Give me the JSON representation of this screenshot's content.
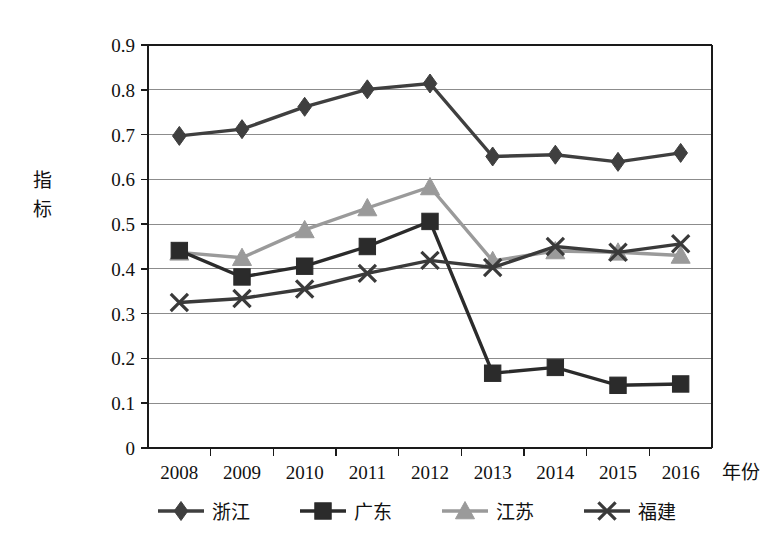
{
  "chart_data": {
    "type": "line",
    "title": "",
    "subtitle": "",
    "xlabel": "年份",
    "ylabel": "指标",
    "x": [
      "2008",
      "2009",
      "2010",
      "2011",
      "2012",
      "2013",
      "2014",
      "2015",
      "2016"
    ],
    "categories": [
      "2008",
      "2009",
      "2010",
      "2011",
      "2012",
      "2013",
      "2014",
      "2015",
      "2016"
    ],
    "ylim": [
      0,
      0.9
    ],
    "xlim_note": "categorical, 9 year bands",
    "yticks": [
      "0",
      "0.1",
      "0.2",
      "0.3",
      "0.4",
      "0.5",
      "0.6",
      "0.7",
      "0.8",
      "0.9"
    ],
    "ytick_values": [
      0,
      0.1,
      0.2,
      0.3,
      0.4,
      0.5,
      0.6,
      0.7,
      0.8,
      0.9
    ],
    "grid": "horizontal",
    "legend_position": "bottom",
    "series": [
      {
        "name": "浙江",
        "marker": "diamond",
        "color": "#3f3f3f",
        "line_color": "#3f3f3f",
        "values": [
          0.697,
          0.712,
          0.762,
          0.801,
          0.814,
          0.651,
          0.655,
          0.639,
          0.659
        ]
      },
      {
        "name": "广东",
        "marker": "square",
        "color": "#2b2b2b",
        "line_color": "#2b2b2b",
        "values": [
          0.441,
          0.382,
          0.406,
          0.45,
          0.506,
          0.167,
          0.18,
          0.14,
          0.143
        ]
      },
      {
        "name": "江苏",
        "marker": "triangle",
        "color": "#9a9a9a",
        "line_color": "#9a9a9a",
        "values": [
          0.437,
          0.425,
          0.487,
          0.536,
          0.583,
          0.418,
          0.44,
          0.437,
          0.43
        ]
      },
      {
        "name": "福建",
        "marker": "x",
        "color": "#3a3a3a",
        "line_color": "#3a3a3a",
        "values": [
          0.325,
          0.334,
          0.355,
          0.39,
          0.419,
          0.403,
          0.45,
          0.437,
          0.456
        ]
      }
    ]
  },
  "axes": {
    "y_axis_title": "指标",
    "x_axis_title": "年份"
  },
  "legend": {
    "items": [
      {
        "label": "浙江",
        "marker": "diamond-icon",
        "color": "#3f3f3f"
      },
      {
        "label": "广东",
        "marker": "square-icon",
        "color": "#2b2b2b"
      },
      {
        "label": "江苏",
        "marker": "triangle-icon",
        "color": "#9a9a9a"
      },
      {
        "label": "福建",
        "marker": "x-icon",
        "color": "#3a3a3a"
      }
    ]
  },
  "colors": {
    "background": "#ffffff",
    "axis": "#1a1a1a",
    "gridline": "#8c8c8c",
    "text": "#111111"
  }
}
